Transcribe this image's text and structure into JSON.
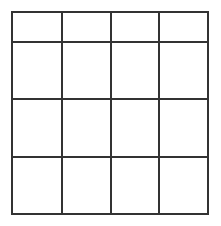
{
  "figure": {
    "name": "empty-4x4-grid",
    "kind": "grid-diagram",
    "rows": 4,
    "columns": 4,
    "cell_count": 16,
    "background_color": "#ffffff",
    "line_color": "#333333",
    "line_width_px": 2,
    "position": {
      "x": 11,
      "y": 11
    },
    "size": {
      "width": 198,
      "height": 204
    },
    "cell_size": {
      "width": 49.5,
      "height": 51
    },
    "cells": [
      [
        "",
        "",
        "",
        ""
      ],
      [
        "",
        "",
        "",
        ""
      ],
      [
        "",
        "",
        "",
        ""
      ],
      [
        "",
        "",
        "",
        ""
      ]
    ]
  }
}
